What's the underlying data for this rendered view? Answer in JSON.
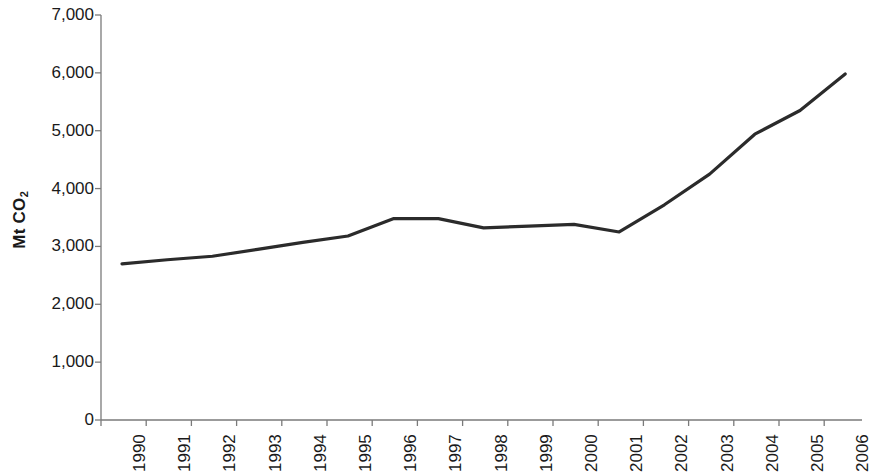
{
  "chart_data": {
    "type": "line",
    "title": "",
    "subtitle": "",
    "xlabel": "",
    "ylabel": "Mt CO2",
    "ylabel_parts": {
      "main": "Mt CO",
      "subscript": "2"
    },
    "categories": [
      "1990",
      "1991",
      "1992",
      "1993",
      "1994",
      "1995",
      "1996",
      "1997",
      "1998",
      "1999",
      "2000",
      "2001",
      "2002",
      "2003",
      "2004",
      "2005",
      "2006"
    ],
    "values": [
      2700,
      2770,
      2830,
      2950,
      3070,
      3180,
      3480,
      3480,
      3320,
      3350,
      3380,
      3250,
      3720,
      4250,
      4940,
      5350,
      5980
    ],
    "series": [
      {
        "name": "Mt CO2",
        "values": [
          2700,
          2770,
          2830,
          2950,
          3070,
          3180,
          3480,
          3480,
          3320,
          3350,
          3380,
          3250,
          3720,
          4250,
          4940,
          5350,
          5980
        ]
      }
    ],
    "ylim": [
      0,
      7000
    ],
    "y_ticks": [
      0,
      1000,
      2000,
      3000,
      4000,
      5000,
      6000,
      7000
    ],
    "y_tick_labels": [
      "0",
      "1,000",
      "2,000",
      "3,000",
      "4,000",
      "5,000",
      "6,000",
      "7,000"
    ],
    "grid": false,
    "legend": false,
    "legend_position": "none",
    "line_color": "#2b2b2b",
    "axis_color": "#7a7a7a",
    "text_color": "#1a1a1a",
    "x_tick_label_rotation": -90,
    "annotations": []
  }
}
